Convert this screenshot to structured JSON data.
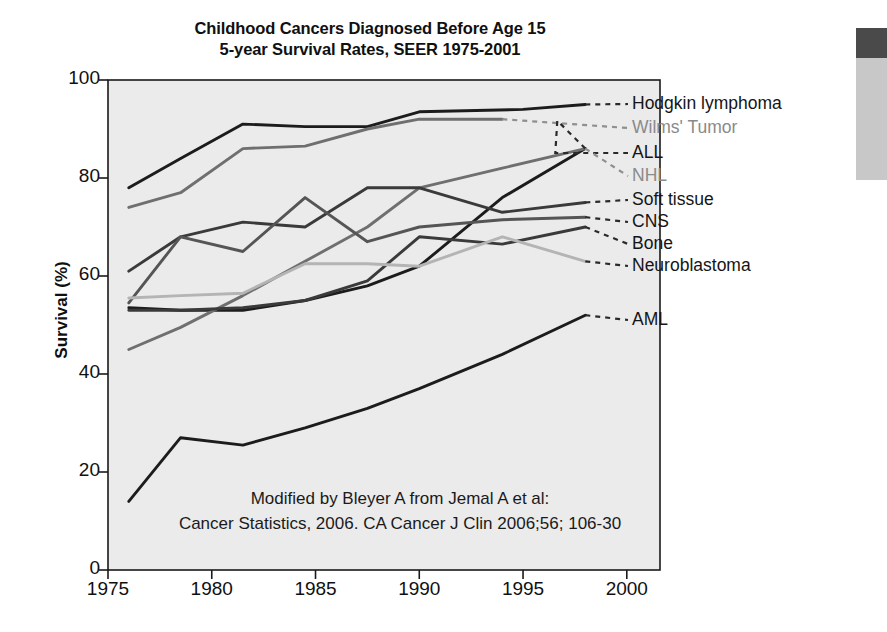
{
  "title": {
    "line1": "Childhood Cancers Diagnosed Before Age 15",
    "line2": "5-year Survival Rates, SEER 1975-2001"
  },
  "attribution": {
    "line1": "Modified by Bleyer A from Jemal A et al:",
    "line2": "Cancer Statistics, 2006. CA Cancer J Clin 2006;56; 106-30"
  },
  "axes": {
    "ylabel": "Survival (%)",
    "yticks": [
      "0",
      "20",
      "40",
      "60",
      "80",
      "100"
    ],
    "xticks": [
      "1975",
      "1980",
      "1985",
      "1990",
      "1995",
      "2000"
    ]
  },
  "colors": {
    "plot_background": "#ebebeb",
    "axis": "#1a1a1a",
    "series_dark": "#1c1c1c",
    "series_mid": "#555555",
    "series_gray": "#8f8f8f",
    "series_light": "#b4b4b4",
    "label_gray": "#8a8a8a",
    "scan_dark": "#4a4a4a",
    "scan_light": "#c8c8c8"
  },
  "chart_data": {
    "type": "line",
    "xlabel": "",
    "ylabel": "Survival (%)",
    "xlim": [
      1975,
      2001
    ],
    "ylim": [
      0,
      100
    ],
    "grid": false,
    "legend_position": "right-inline-labels",
    "series": [
      {
        "name": "Hodgkin lymphoma",
        "color": "#1c1c1c",
        "label_color": "#151515",
        "x": [
          1976,
          1978.5,
          1981.5,
          1984.5,
          1987.5,
          1990,
          1995,
          1998
        ],
        "y": [
          78,
          84,
          91,
          90.5,
          90.5,
          93.5,
          94,
          95
        ]
      },
      {
        "name": "Wilms' Tumor",
        "color": "#6f6f6f",
        "label_color": "#8a8a8a",
        "x": [
          1976,
          1978.5,
          1981.5,
          1984.5,
          1987.5,
          1990,
          1994
        ],
        "y": [
          74,
          77,
          86,
          86.5,
          90,
          92,
          92
        ]
      },
      {
        "name": "ALL",
        "color": "#1c1c1c",
        "label_color": "#151515",
        "x": [
          1976,
          1978.5,
          1981.5,
          1984.5,
          1987.5,
          1990,
          1994,
          1998
        ],
        "y": [
          53.5,
          53,
          53,
          55,
          58,
          62,
          76,
          86
        ]
      },
      {
        "name": "NHL",
        "color": "#6f6f6f",
        "label_color": "#8a8a8a",
        "x": [
          1976,
          1978.5,
          1981.5,
          1984.5,
          1987.5,
          1990,
          1994,
          1998
        ],
        "y": [
          45,
          49.5,
          56,
          63,
          70,
          78,
          82,
          86
        ]
      },
      {
        "name": "Soft tissue",
        "color": "#3a3a3a",
        "label_color": "#151515",
        "x": [
          1976,
          1978.5,
          1981.5,
          1984.5,
          1987.5,
          1990,
          1994,
          1998
        ],
        "y": [
          61,
          68,
          71,
          70,
          78,
          78,
          73,
          75
        ]
      },
      {
        "name": "CNS",
        "color": "#555555",
        "label_color": "#151515",
        "x": [
          1976,
          1978.5,
          1981.5,
          1984.5,
          1987.5,
          1990,
          1994,
          1998
        ],
        "y": [
          54.5,
          68,
          65,
          76,
          67,
          70,
          71.5,
          72
        ]
      },
      {
        "name": "Bone",
        "color": "#3a3a3a",
        "label_color": "#151515",
        "x": [
          1976,
          1978.5,
          1981.5,
          1984.5,
          1987.5,
          1990,
          1994,
          1998
        ],
        "y": [
          53,
          53,
          53.5,
          55,
          59,
          68,
          66.5,
          70
        ]
      },
      {
        "name": "Neuroblastoma",
        "color": "#b4b4b4",
        "label_color": "#151515",
        "x": [
          1976,
          1978.5,
          1981.5,
          1984.5,
          1987.5,
          1990,
          1994,
          1998
        ],
        "y": [
          55.5,
          56,
          56.5,
          62.5,
          62.5,
          62,
          68,
          63
        ]
      },
      {
        "name": "AML",
        "color": "#1c1c1c",
        "label_color": "#151515",
        "x": [
          1976,
          1978.5,
          1981.5,
          1984.5,
          1987.5,
          1990,
          1994,
          1998
        ],
        "y": [
          14,
          27,
          25.5,
          29,
          33,
          37,
          44,
          52
        ]
      }
    ],
    "legend_labels": [
      {
        "name": "Hodgkin lymphoma",
        "y_px": 104,
        "gray": false
      },
      {
        "name": "Wilms' Tumor",
        "y_px": 128,
        "gray": true
      },
      {
        "name": "ALL",
        "y_px": 153,
        "gray": false
      },
      {
        "name": "NHL",
        "y_px": 176,
        "gray": true
      },
      {
        "name": "Soft tissue",
        "y_px": 200,
        "gray": false
      },
      {
        "name": "CNS",
        "y_px": 222,
        "gray": false
      },
      {
        "name": "Bone",
        "y_px": 244,
        "gray": false
      },
      {
        "name": "Neuroblastoma",
        "y_px": 266,
        "gray": false
      },
      {
        "name": "AML",
        "y_px": 320,
        "gray": false
      }
    ]
  }
}
